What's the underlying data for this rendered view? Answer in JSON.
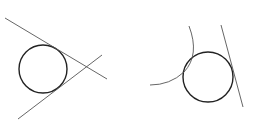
{
  "figures": [
    {
      "name": "circle-with-two-tangent-lines",
      "circle": {
        "cx": 43,
        "cy": 69,
        "r": 24
      },
      "lines": [
        {
          "x1": 5,
          "y1": 18,
          "x2": 107,
          "y2": 79
        },
        {
          "x1": 18,
          "y1": 119,
          "x2": 102,
          "y2": 55
        }
      ]
    },
    {
      "name": "circle-with-tangent-arc-and-line",
      "circle": {
        "cx": 208,
        "cy": 77,
        "r": 25
      },
      "arc": {
        "d": "M 189 26 Q 200 55 184 72 Q 170 85 150 85"
      },
      "lines": [
        {
          "x1": 221,
          "y1": 25,
          "x2": 243,
          "y2": 107
        }
      ]
    }
  ],
  "colors": {
    "line": "#555555",
    "circle": "#222222",
    "background": "#ffffff"
  }
}
